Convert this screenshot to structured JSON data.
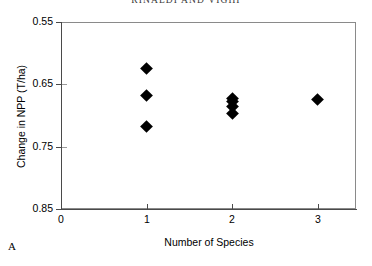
{
  "running_head": "RINALDI AND VIGHI",
  "panel_label": "A",
  "axes": {
    "y_title": "Change in NPP (T/ha)",
    "x_title": "Number of Species",
    "y_ticks": [
      "0.85",
      "0.75",
      "0.65",
      "0.55"
    ],
    "x_ticks": [
      "0",
      "1",
      "2",
      "3"
    ]
  },
  "chart_data": {
    "type": "scatter",
    "title": "",
    "xlabel": "Number of Species",
    "ylabel": "Change in NPP (T/ha)",
    "xlim": [
      0,
      3.45
    ],
    "ylim": [
      0.55,
      0.85
    ],
    "xticks": [
      0,
      1,
      2,
      3
    ],
    "yticks": [
      0.55,
      0.65,
      0.75,
      0.85
    ],
    "grid": false,
    "legend": false,
    "marker": "filled-diamond",
    "marker_color": "#000000",
    "series": [
      {
        "name": "Change in NPP",
        "points": [
          {
            "x": 1,
            "y": 0.776
          },
          {
            "x": 1,
            "y": 0.732
          },
          {
            "x": 1,
            "y": 0.683
          },
          {
            "x": 2,
            "y": 0.728
          },
          {
            "x": 2,
            "y": 0.722
          },
          {
            "x": 2,
            "y": 0.714
          },
          {
            "x": 2,
            "y": 0.704
          },
          {
            "x": 3,
            "y": 0.725
          }
        ]
      }
    ]
  }
}
